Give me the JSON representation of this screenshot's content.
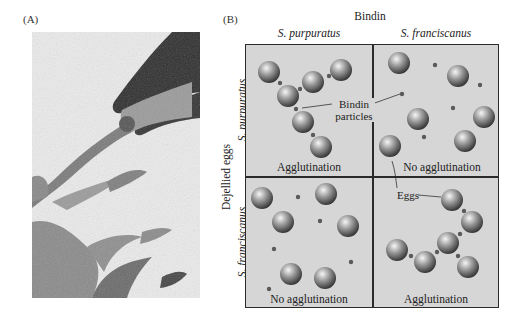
{
  "panel_a": {
    "label": "(A)",
    "image_description": "electron micrograph of sperm acrosomal process contacting egg surface"
  },
  "panel_b": {
    "label": "(B)",
    "column_group_title": "Bindin",
    "column_headers": [
      "S. purpuratus",
      "S. franciscanus"
    ],
    "row_group_title": "Dejellied eggs",
    "row_headers": [
      "S. purpuratus",
      "S. franciscanus"
    ],
    "cells": [
      {
        "row": 0,
        "col": 0,
        "result": "Agglutination"
      },
      {
        "row": 0,
        "col": 1,
        "result": "No agglutination"
      },
      {
        "row": 1,
        "col": 0,
        "result": "No agglutination"
      },
      {
        "row": 1,
        "col": 1,
        "result": "Agglutination"
      }
    ],
    "annotations": {
      "bindin_particles": "Bindin particles",
      "bindin_line1": "Bindin",
      "bindin_line2": "particles",
      "eggs": "Eggs"
    }
  },
  "colors": {
    "cell_background": "#d6d6d6",
    "grid_border": "#2a2a2a",
    "egg_dark": "#3a3a3a",
    "egg_light": "#f4f4f4",
    "particle": "#5a5a5a"
  }
}
